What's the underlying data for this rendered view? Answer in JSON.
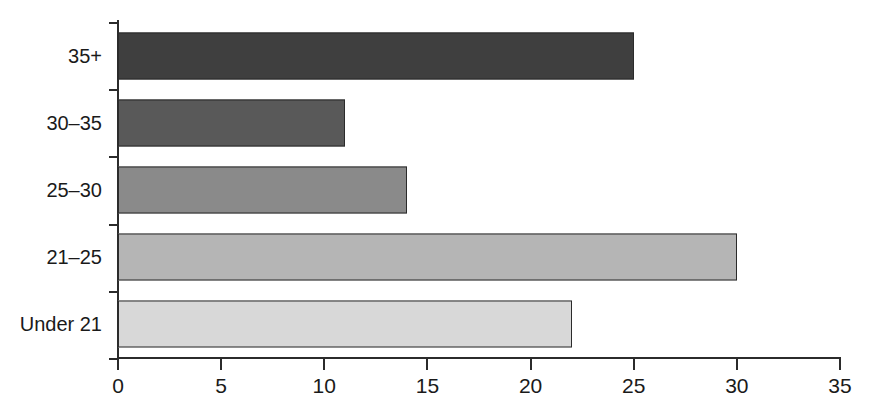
{
  "chart_data": {
    "type": "bar",
    "orientation": "horizontal",
    "title": "",
    "subtitle": "",
    "xlabel": "",
    "ylabel": "",
    "categories": [
      "Under 21",
      "21–25",
      "25–30",
      "30–35",
      "35+"
    ],
    "values": [
      22,
      30,
      14,
      11,
      25
    ],
    "bars": [
      {
        "category": "35+",
        "value": 25,
        "color": "#3f3f3f"
      },
      {
        "category": "30–35",
        "value": 11,
        "color": "#595959"
      },
      {
        "category": "25–30",
        "value": 14,
        "color": "#8a8a8a"
      },
      {
        "category": "21–25",
        "value": 30,
        "color": "#b5b5b5"
      },
      {
        "category": "Under 21",
        "value": 22,
        "color": "#d8d8d8"
      }
    ],
    "xlim": [
      0,
      35
    ],
    "xticks": [
      0,
      5,
      10,
      15,
      20,
      25,
      30,
      35
    ],
    "xtick_labels": [
      "0",
      "5",
      "10",
      "15",
      "20",
      "25",
      "30",
      "35"
    ],
    "grid": false,
    "legend": false,
    "legend_position": "none",
    "axis_color": "#2b2b2b",
    "background": "#ffffff"
  }
}
